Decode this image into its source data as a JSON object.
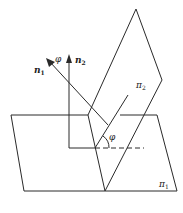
{
  "diagram": {
    "type": "dihedral-angle-normals",
    "colors": {
      "stroke": "#2a2a2a",
      "background": "#ffffff"
    },
    "labels": {
      "n1": "n",
      "n1_sub": "1",
      "n2": "n",
      "n2_sub": "2",
      "phi_top": "φ",
      "phi_angle": "φ",
      "plane2": "π",
      "plane2_sub": "2",
      "plane1": "π",
      "plane1_sub": "1"
    },
    "elements": [
      "plane π1 (horizontal parallelogram)",
      "plane π2 (inclined parallelogram)",
      "normal vector n1",
      "normal vector n2",
      "angle φ between normals",
      "dihedral angle φ"
    ]
  }
}
